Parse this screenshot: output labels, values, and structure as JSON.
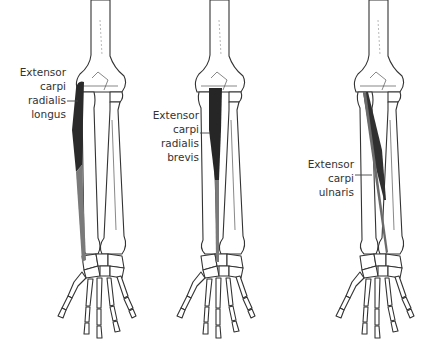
{
  "figures": [
    {
      "id": "ecrl",
      "label_lines": [
        "Extensor",
        "carpi",
        "radialis",
        "longus"
      ],
      "muscle_color": "#2a2a2a",
      "tendon_color": "#7a7a7a"
    },
    {
      "id": "ecrb",
      "label_lines": [
        "Extensor",
        "carpi",
        "radialis",
        "brevis"
      ],
      "muscle_color": "#262626",
      "tendon_color": "#7a7a7a"
    },
    {
      "id": "ecu",
      "label_lines": [
        "Extensor",
        "carpi",
        "ulnaris"
      ],
      "muscle_color": "#303030",
      "tendon_color": "#6a6a6a"
    }
  ],
  "colors": {
    "background": "#ffffff",
    "outline": "#333333",
    "text": "#333333"
  }
}
